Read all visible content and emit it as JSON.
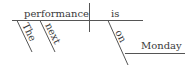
{
  "diagram": {
    "type": "sentence-diagram",
    "sentence": "The next performance is on Monday",
    "subject": "performance",
    "verb": "is",
    "modifiers": [
      {
        "word": "The",
        "modifies": "performance"
      },
      {
        "word": "next",
        "modifies": "performance"
      }
    ],
    "preposition": {
      "word": "on",
      "object": "Monday",
      "modifies": "is"
    },
    "colors": {
      "line": "#555555",
      "text": "#3a3a3a",
      "background": "#ffffff"
    }
  }
}
